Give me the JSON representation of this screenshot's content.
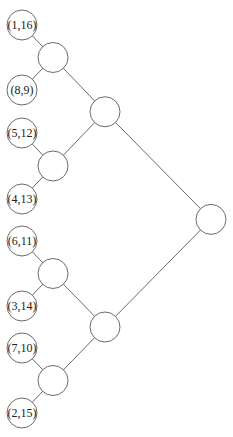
{
  "diagram": {
    "type": "binary-tree",
    "leaves": [
      {
        "id": "l1",
        "label": "(1,16)"
      },
      {
        "id": "l2",
        "label": "(8,9)"
      },
      {
        "id": "l3",
        "label": "(5,12)"
      },
      {
        "id": "l4",
        "label": "(4,13)"
      },
      {
        "id": "l5",
        "label": "(6,11)"
      },
      {
        "id": "l6",
        "label": "(3,14)"
      },
      {
        "id": "l7",
        "label": "(7,10)"
      },
      {
        "id": "l8",
        "label": "(2,15)"
      }
    ],
    "internal_nodes": [
      {
        "id": "a1",
        "label": "",
        "children": [
          "l1",
          "l2"
        ]
      },
      {
        "id": "a2",
        "label": "",
        "children": [
          "l3",
          "l4"
        ]
      },
      {
        "id": "a3",
        "label": "",
        "children": [
          "l5",
          "l6"
        ]
      },
      {
        "id": "a4",
        "label": "",
        "children": [
          "l7",
          "l8"
        ]
      },
      {
        "id": "b1",
        "label": "",
        "children": [
          "a1",
          "a2"
        ]
      },
      {
        "id": "b2",
        "label": "",
        "children": [
          "a3",
          "a4"
        ]
      },
      {
        "id": "root",
        "label": "",
        "children": [
          "b1",
          "b2"
        ]
      }
    ]
  }
}
